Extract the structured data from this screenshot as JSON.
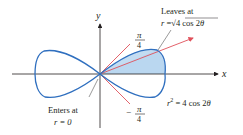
{
  "figure": {
    "equation": "r² = 4 cos 2θ",
    "equation_parts": {
      "lhs": "r",
      "exp": "2",
      "rhs": " = 4 cos 2",
      "theta": "θ"
    },
    "axes": {
      "x_label": "x",
      "y_label": "y"
    },
    "angles": {
      "upper": {
        "sign": "",
        "num": "π",
        "den": "4"
      },
      "lower": {
        "sign": "−",
        "num": "π",
        "den": "4"
      }
    },
    "annotations": {
      "leaves": {
        "line1": "Leaves at",
        "line2_prefix": "r =",
        "line2_root": "√",
        "line2_body": "4 cos 2",
        "theta": "θ"
      },
      "enters": {
        "line1": "Enters at",
        "line2": "r = 0"
      }
    },
    "colors": {
      "curve": "#2f6fbf",
      "fill": "#b9d6f0",
      "ray": "#e0505a",
      "axis": "#231f20",
      "leader": "#555555"
    }
  }
}
